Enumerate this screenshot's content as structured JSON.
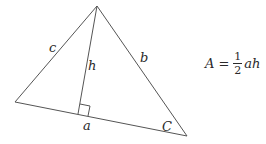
{
  "diagram": {
    "stroke_color": "#555555",
    "vertices": {
      "apex": [
        97,
        6
      ],
      "left": [
        15,
        102
      ],
      "right": [
        187,
        136
      ],
      "altitude_foot": [
        78,
        114
      ]
    },
    "labels": {
      "side_c": "c",
      "side_b": "b",
      "height": "h",
      "base": "a",
      "angle": "C"
    },
    "formula": {
      "lhs": "A",
      "equals": "=",
      "numerator": "1",
      "denominator": "2",
      "rhs_vars": "ah"
    }
  }
}
